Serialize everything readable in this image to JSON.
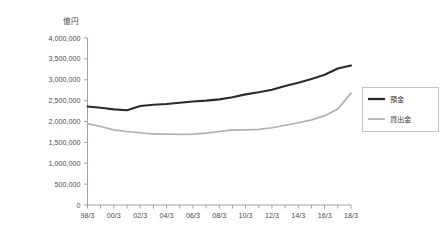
{
  "chart_data": {
    "type": "line",
    "title": "",
    "xlabel": "",
    "ylabel": "",
    "unit_label": "億円",
    "grid": false,
    "legend_position": "right",
    "ylim": [
      0,
      4000000
    ],
    "ytick_labels": [
      "0",
      "500,000",
      "1,000,000",
      "1,500,000",
      "2,000,000",
      "2,500,000",
      "3,000,000",
      "3,500,000",
      "4,000,000"
    ],
    "ytick_values": [
      0,
      500000,
      1000000,
      1500000,
      2000000,
      2500000,
      3000000,
      3500000,
      4000000
    ],
    "x": [
      "98/3",
      "99/3",
      "00/3",
      "01/3",
      "02/3",
      "03/3",
      "04/3",
      "05/3",
      "06/3",
      "07/3",
      "08/3",
      "09/3",
      "10/3",
      "11/3",
      "12/3",
      "13/3",
      "14/3",
      "15/3",
      "16/3",
      "17/3",
      "18/3"
    ],
    "xtick_labels": [
      "98/3",
      "",
      "00/3",
      "",
      "02/3",
      "",
      "04/3",
      "",
      "06/3",
      "",
      "08/3",
      "",
      "10/3",
      "",
      "12/3",
      "",
      "14/3",
      "",
      "16/3",
      "",
      "18/3"
    ],
    "series": [
      {
        "name": "預金",
        "color": "#2b2b2b",
        "values": [
          2360000,
          2330000,
          2290000,
          2270000,
          2370000,
          2400000,
          2420000,
          2450000,
          2480000,
          2500000,
          2530000,
          2580000,
          2650000,
          2700000,
          2760000,
          2850000,
          2930000,
          3020000,
          3120000,
          3270000,
          3340000
        ]
      },
      {
        "name": "貸出金",
        "color": "#b0b0b0",
        "values": [
          1950000,
          1880000,
          1800000,
          1760000,
          1730000,
          1700000,
          1700000,
          1690000,
          1700000,
          1720000,
          1760000,
          1800000,
          1800000,
          1810000,
          1850000,
          1910000,
          1970000,
          2040000,
          2140000,
          2300000,
          2680000
        ]
      }
    ]
  },
  "legend": {
    "items": [
      {
        "label": "預金"
      },
      {
        "label": "貸出金"
      }
    ]
  }
}
